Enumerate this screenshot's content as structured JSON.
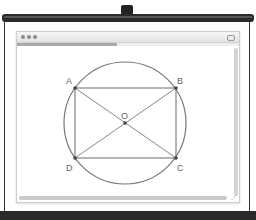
{
  "window": {
    "controls": [
      "close",
      "minimize",
      "zoom"
    ],
    "progress_percent": 45
  },
  "diagram": {
    "points": [
      {
        "label": "A",
        "x": 75,
        "y": 88
      },
      {
        "label": "B",
        "x": 176,
        "y": 88
      },
      {
        "label": "C",
        "x": 176,
        "y": 158
      },
      {
        "label": "D",
        "x": 75,
        "y": 158
      },
      {
        "label": "O",
        "x": 125,
        "y": 123
      }
    ],
    "circle": {
      "cx": 125,
      "cy": 123,
      "r": 61
    },
    "stroke_color": "#777777",
    "point_color": "#444444"
  },
  "labels": {
    "A": "A",
    "B": "B",
    "C": "C",
    "D": "D",
    "O": "O"
  },
  "icons": {
    "resize": "resize-grip-icon"
  }
}
